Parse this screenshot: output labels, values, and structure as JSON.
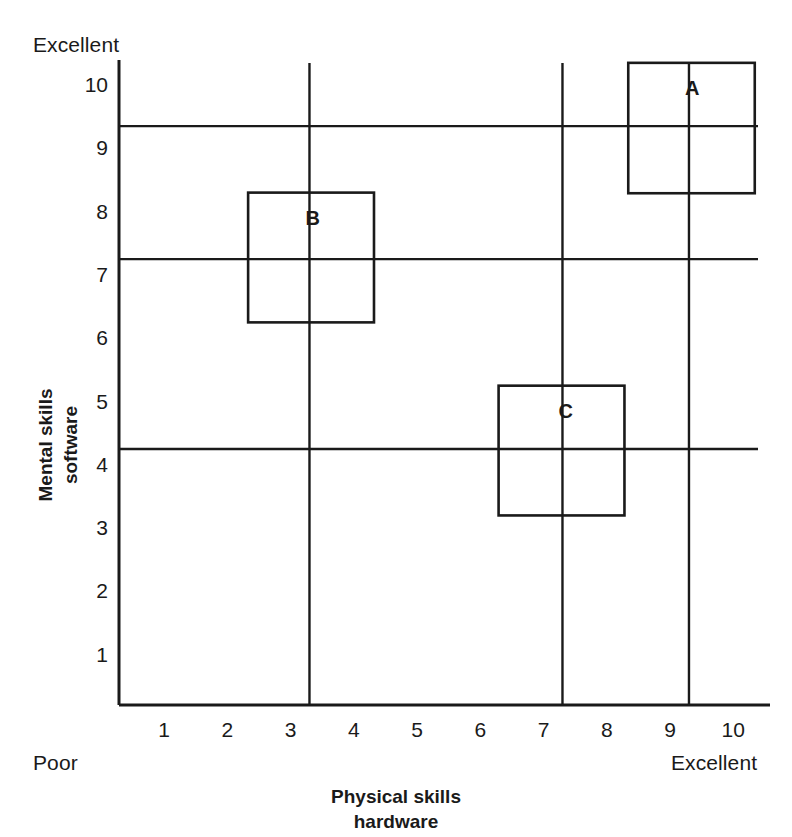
{
  "chart_data": {
    "type": "scatter",
    "title": "",
    "xlabel": "Physical skills hardware",
    "ylabel": "Mental skills software",
    "xlabel_lines": [
      "Physical skills",
      "hardware"
    ],
    "ylabel_lines": [
      "Mental skills",
      "software"
    ],
    "xlim": [
      0.3,
      10.7
    ],
    "ylim": [
      0.3,
      10.7
    ],
    "grid": false,
    "legend": null,
    "axis_extreme_labels": {
      "y_top": "Excellent",
      "x_left": "Poor",
      "x_right": "Excellent"
    },
    "xticks": [
      1,
      2,
      3,
      4,
      5,
      6,
      7,
      8,
      9,
      10
    ],
    "yticks": [
      1,
      2,
      3,
      4,
      5,
      6,
      7,
      8,
      9,
      10
    ],
    "xtick_labels": [
      "1",
      "2",
      "3",
      "4",
      "5",
      "6",
      "7",
      "8",
      "9",
      "10"
    ],
    "ytick_labels": [
      "1",
      "2",
      "3",
      "4",
      "5",
      "6",
      "7",
      "8",
      "9",
      "10"
    ],
    "annotations": [
      {
        "label": "A",
        "x": 9.3,
        "y": 9.35,
        "box_x_range": [
          8.34,
          10.34
        ],
        "box_y_range": [
          8.29,
          10.35
        ],
        "label_x": 9.35,
        "label_y": 9.95
      },
      {
        "label": "B",
        "x": 3.3,
        "y": 7.25,
        "box_x_range": [
          2.33,
          4.32
        ],
        "box_y_range": [
          6.25,
          8.3
        ],
        "label_x": 3.35,
        "label_y": 7.9
      },
      {
        "label": "C",
        "x": 7.3,
        "y": 4.25,
        "box_x_range": [
          6.29,
          8.28
        ],
        "box_y_range": [
          3.2,
          5.25
        ],
        "label_x": 7.35,
        "label_y": 4.85
      }
    ],
    "crosshair_vertical_lines": [
      3.3,
      7.3,
      9.3
    ],
    "crosshair_horizontal_lines": [
      4.25,
      7.25,
      9.35
    ],
    "colors": {
      "line": "#1a1a1a",
      "background": "#ffffff",
      "text": "#1a1a1a"
    }
  }
}
